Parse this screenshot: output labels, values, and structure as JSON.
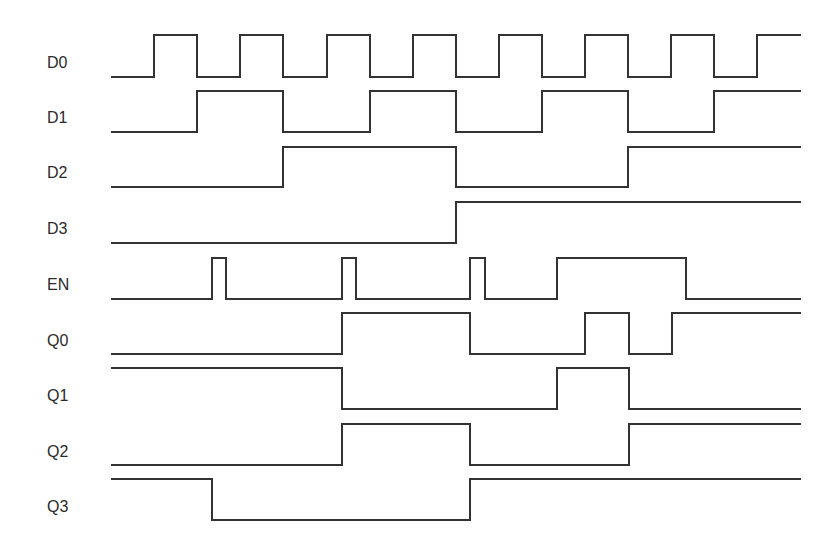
{
  "diagram": {
    "type": "timing-diagram",
    "line_color": "#333333",
    "background": "#ffffff",
    "x_start": 111,
    "x_end": 801,
    "signals": [
      {
        "name": "D0",
        "label_y": 63,
        "y_high": 35,
        "y_low": 77,
        "initial": "low",
        "transitions": [
          154,
          197,
          240,
          283,
          327,
          370,
          413,
          456,
          499,
          542,
          585,
          628,
          671,
          714,
          757
        ]
      },
      {
        "name": "D1",
        "label_y": 118,
        "y_high": 91,
        "y_low": 132,
        "initial": "low",
        "transitions": [
          197,
          283,
          370,
          456,
          542,
          628,
          714
        ]
      },
      {
        "name": "D2",
        "label_y": 173,
        "y_high": 147,
        "y_low": 187,
        "initial": "low",
        "transitions": [
          283,
          456,
          628
        ]
      },
      {
        "name": "D3",
        "label_y": 229,
        "y_high": 202,
        "y_low": 243,
        "initial": "low",
        "transitions": [
          456
        ]
      },
      {
        "name": "EN",
        "label_y": 285,
        "y_high": 258,
        "y_low": 299,
        "initial": "low",
        "transitions": [
          212,
          226,
          342,
          356,
          470,
          485,
          557,
          686
        ]
      },
      {
        "name": "Q0",
        "label_y": 341,
        "y_high": 313,
        "y_low": 354,
        "initial": "low",
        "transitions": [
          342,
          470,
          585,
          629,
          672
        ]
      },
      {
        "name": "Q1",
        "label_y": 396,
        "y_high": 368,
        "y_low": 409,
        "initial": "high",
        "transitions": [
          342,
          557,
          629
        ]
      },
      {
        "name": "Q2",
        "label_y": 452,
        "y_high": 424,
        "y_low": 465,
        "initial": "low",
        "transitions": [
          342,
          470,
          629
        ]
      },
      {
        "name": "Q3",
        "label_y": 507,
        "y_high": 479,
        "y_low": 520,
        "initial": "high",
        "transitions": [
          212,
          470
        ]
      }
    ]
  }
}
